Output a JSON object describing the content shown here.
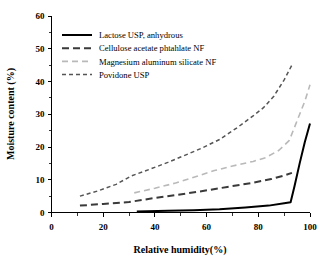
{
  "chart_data": {
    "type": "line",
    "title": "",
    "xlabel": "Relative humidity(%)",
    "ylabel": "Moisture content (%)",
    "xlim": [
      0,
      100
    ],
    "ylim": [
      0,
      60
    ],
    "xticks": [
      0,
      20,
      40,
      60,
      80,
      100
    ],
    "yticks": [
      0,
      10,
      20,
      30,
      40,
      50,
      60
    ],
    "xtick_labels": [
      "0",
      "20",
      "40",
      "60",
      "80",
      "100"
    ],
    "ytick_labels": [
      "0",
      "10",
      "20",
      "30",
      "40",
      "50",
      "60"
    ],
    "x_minor_step": 10,
    "y_minor_step": 5,
    "grid": false,
    "legend_position": "upper-left-inside",
    "series": [
      {
        "name": "Lactose USP, anhydrous",
        "style": "solid",
        "color": "#000000",
        "width": 2.0,
        "dash": "none",
        "points": [
          [
            33,
            0.3
          ],
          [
            45,
            0.5
          ],
          [
            55,
            0.7
          ],
          [
            65,
            1.0
          ],
          [
            75,
            1.5
          ],
          [
            84,
            2.1
          ],
          [
            90,
            2.8
          ],
          [
            92.5,
            3.1
          ],
          [
            94,
            8.0
          ],
          [
            96,
            15.0
          ],
          [
            98,
            21.5
          ],
          [
            100,
            27.2
          ]
        ]
      },
      {
        "name": "Cellulose acetate phtahlate NF",
        "style": "long-dash",
        "color": "#3a3a3a",
        "width": 2.0,
        "dash": "7,4",
        "points": [
          [
            11,
            2.1
          ],
          [
            20,
            2.6
          ],
          [
            30,
            3.2
          ],
          [
            38,
            4.2
          ],
          [
            48,
            5.3
          ],
          [
            58,
            6.5
          ],
          [
            68,
            7.8
          ],
          [
            78,
            9.1
          ],
          [
            85,
            10.2
          ],
          [
            90,
            11.3
          ],
          [
            93,
            12.1
          ]
        ]
      },
      {
        "name": "Magnesium aluminum silicate NF",
        "style": "dash",
        "color": "#b9b9b9",
        "width": 1.6,
        "dash": "6,4",
        "points": [
          [
            32,
            6.0
          ],
          [
            40,
            7.4
          ],
          [
            48,
            9.0
          ],
          [
            56,
            11.0
          ],
          [
            63,
            12.8
          ],
          [
            70,
            14.2
          ],
          [
            78,
            15.6
          ],
          [
            83,
            16.8
          ],
          [
            88,
            19.0
          ],
          [
            92,
            22.0
          ],
          [
            95,
            28.0
          ],
          [
            98,
            34.0
          ],
          [
            100,
            39.0
          ]
        ]
      },
      {
        "name": "Povidone USP",
        "style": "short-dash",
        "color": "#555555",
        "width": 1.5,
        "dash": "4,3",
        "points": [
          [
            11,
            5.0
          ],
          [
            18,
            6.6
          ],
          [
            25,
            8.6
          ],
          [
            31,
            11.2
          ],
          [
            38,
            13.2
          ],
          [
            45,
            15.3
          ],
          [
            52,
            17.6
          ],
          [
            58,
            19.6
          ],
          [
            65,
            22.3
          ],
          [
            72,
            26.0
          ],
          [
            78,
            29.5
          ],
          [
            82,
            32.0
          ],
          [
            86,
            35.5
          ],
          [
            90,
            40.5
          ],
          [
            93,
            45.0
          ]
        ]
      }
    ]
  },
  "legend": {
    "entries": [
      {
        "label": "Lactose USP, anhydrous"
      },
      {
        "label": "Cellulose acetate phtahlate NF"
      },
      {
        "label": "Magnesium aluminum silicate NF"
      },
      {
        "label": "Povidone USP"
      }
    ]
  }
}
